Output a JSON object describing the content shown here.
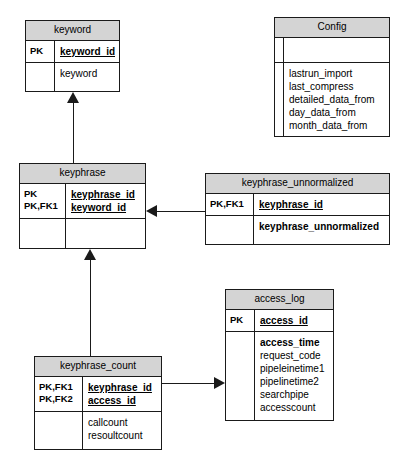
{
  "diagram": {
    "background_color": "#ffffff",
    "header_fill": "#d4d4d4",
    "line_color": "#1a1a1a"
  },
  "entities": [
    {
      "id": "keyword",
      "name": "keyword",
      "key_labels": [
        "PK"
      ],
      "key_columns": [
        "keyword_id"
      ],
      "attributes": [
        "keyword"
      ],
      "attributes_bold": []
    },
    {
      "id": "config",
      "name": "Config",
      "key_labels": [],
      "key_columns": [],
      "attributes": [
        "lastrun_import",
        "last_compress",
        "detailed_data_from",
        "day_data_from",
        "month_data_from"
      ],
      "attributes_bold": []
    },
    {
      "id": "keyphrase",
      "name": "keyphrase",
      "key_labels": [
        "PK",
        "PK,FK1"
      ],
      "key_columns": [
        "keyphrase_id",
        "keyword_id"
      ],
      "attributes": [],
      "attributes_bold": []
    },
    {
      "id": "keyphrase_unnormalized",
      "name": "keyphrase_unnormalized",
      "key_labels": [
        "PK,FK1"
      ],
      "key_columns": [
        "keyphrase_id"
      ],
      "attributes": [
        "keyphrase_unnormalized"
      ],
      "attributes_bold": [
        "keyphrase_unnormalized"
      ]
    },
    {
      "id": "keyphrase_count",
      "name": "keyphrase_count",
      "key_labels": [
        "PK,FK1",
        "PK,FK2"
      ],
      "key_columns": [
        "keyphrase_id",
        "access_id"
      ],
      "attributes": [
        "callcount",
        "resoultcount"
      ],
      "attributes_bold": []
    },
    {
      "id": "access_log",
      "name": "access_log",
      "key_labels": [
        "PK"
      ],
      "key_columns": [
        "access_id"
      ],
      "attributes": [
        "access_time",
        "request_code",
        "pipeleinetime1",
        "pipelinetime2",
        "searchpipe",
        "accesscount"
      ],
      "attributes_bold": [
        "access_time"
      ]
    }
  ],
  "relationships": [
    {
      "id": "keyphrase-to-keyword",
      "from": "keyphrase",
      "to": "keyword",
      "direction": "up"
    },
    {
      "id": "keyphrase_unnormalized-to-keyphrase",
      "from": "keyphrase_unnormalized",
      "to": "keyphrase",
      "direction": "left"
    },
    {
      "id": "keyphrase_count-to-keyphrase",
      "from": "keyphrase_count",
      "to": "keyphrase",
      "direction": "up"
    },
    {
      "id": "keyphrase_count-to-access_log",
      "from": "keyphrase_count",
      "to": "access_log",
      "direction": "right"
    }
  ]
}
